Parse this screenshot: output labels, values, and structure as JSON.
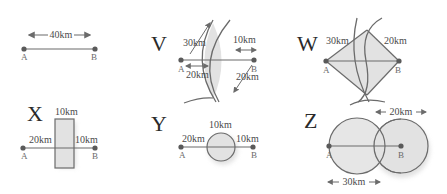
{
  "colors": {
    "line": "#6b6b6b",
    "fill": "#e2e2e2",
    "text": "#4a4a4a",
    "point": "#5a5a5a"
  },
  "panels": {
    "plain": {
      "label": "",
      "distance": "40km",
      "point_a": "A",
      "point_b": "B"
    },
    "V": {
      "label": "V",
      "radius_a": "30km",
      "radius_b_arrow": "10km",
      "gap_a": "20km",
      "radius_b": "20km",
      "point_a": "A",
      "point_b": "B"
    },
    "W": {
      "label": "W",
      "radius_a": "30km",
      "radius_b": "20km",
      "point_a": "A",
      "point_b": "B"
    },
    "X": {
      "label": "X",
      "width": "10km",
      "left": "20km",
      "right": "10km",
      "point_a": "A",
      "point_b": "B"
    },
    "Y": {
      "label": "Y",
      "diameter": "10km",
      "left": "20km",
      "right": "10km",
      "point_a": "A",
      "point_b": "B"
    },
    "Z": {
      "label": "Z",
      "radius_b": "20km",
      "radius_a": "30km",
      "point_a": "A",
      "point_b": "B"
    }
  }
}
